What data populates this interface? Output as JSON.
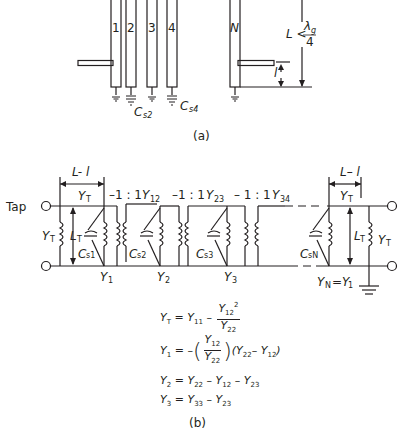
{
  "figure_a": {
    "caption": "(a)",
    "resonators": [
      {
        "label": "1"
      },
      {
        "label": "2"
      },
      {
        "label": "3"
      },
      {
        "label": "4"
      },
      {
        "label": "N"
      }
    ],
    "capacitor_labels": {
      "c2": "C",
      "c2_sub": "s2",
      "c4": "C",
      "c4_sub": "s4"
    },
    "length_label": "L <",
    "length_frac_num": "λ",
    "length_frac_num_sub": "g",
    "length_frac_den": "4",
    "tap_distance_label": "l"
  },
  "figure_b": {
    "caption": "(b)",
    "tap_label": "Tap",
    "left_dim": "L- l",
    "right_dim": "L– l",
    "labels": {
      "YT_top_left": "Y",
      "YT_top_left_sub": "T",
      "YT_left": "Y",
      "YT_left_sub": "T",
      "LT_left": "L",
      "LT_left_sub": "T",
      "Cs1": "C",
      "Cs1_sub": "s1",
      "Cs2": "C",
      "Cs2_sub": "s2",
      "Cs3": "C",
      "Cs3_sub": "s3",
      "CsN": "C",
      "CsN_sub": "sN",
      "ratio1": "–1 : 1",
      "ratio2": "–1 : 1",
      "ratio3": "– 1 : 1",
      "Y12": "Y",
      "Y12_sub": "12",
      "Y23": "Y",
      "Y23_sub": "23",
      "Y34": "Y",
      "Y34_sub": "34",
      "Y1": "Y",
      "Y1_sub": "1",
      "Y2": "Y",
      "Y2_sub": "2",
      "Y3": "Y",
      "Y3_sub": "3",
      "YN": "Y",
      "YN_sub": "N",
      "YN_eq": "=Y",
      "YN_eq_sub": "1",
      "YT_top_right": "Y",
      "YT_top_right_sub": "T",
      "LT_right": "L",
      "LT_right_sub": "T",
      "YT_right": "Y",
      "YT_right_sub": "T"
    },
    "equations": [
      {
        "lhs": "Y",
        "lhs_sub": "T",
        "text": "= Y",
        "t_sub": "11",
        "minus": "–",
        "num": "Y",
        "num_sub": "12",
        "num_sup": "2",
        "den": "Y",
        "den_sub": "22"
      },
      {
        "lhs": "Y",
        "lhs_sub": "1",
        "text": "= –",
        "num": "Y",
        "num_sub": "12",
        "den": "Y",
        "den_sub": "22",
        "rest": "(Y",
        "rest_sub": "22",
        "rest2": "– Y",
        "rest2_sub": "12",
        "close": ")"
      },
      {
        "lhs": "Y",
        "lhs_sub": "2",
        "text": "= Y",
        "a_sub": "22",
        "b": "– Y",
        "b_sub": "12",
        "c": "– Y",
        "c_sub": "23"
      },
      {
        "lhs": "Y",
        "lhs_sub": "3",
        "text": "= Y",
        "a_sub": "33",
        "b": "– Y",
        "b_sub": "23"
      }
    ]
  }
}
